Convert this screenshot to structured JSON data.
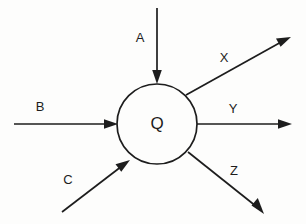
{
  "diagram": {
    "type": "node-flow-diagram",
    "background_color": "#fdfdfc",
    "stroke_color": "#1d1d1d",
    "node": {
      "label": "Q",
      "shape": "circle",
      "center_x": 157,
      "center_y": 124,
      "radius": 40
    },
    "inputs": [
      {
        "label": "A",
        "direction": "from-top",
        "label_x": 140,
        "label_y": 39,
        "x1": 157,
        "y1": 8,
        "x2": 157,
        "y2": 78
      },
      {
        "label": "B",
        "direction": "from-left",
        "label_x": 40,
        "label_y": 108,
        "x1": 14,
        "y1": 124,
        "x2": 111,
        "y2": 124
      },
      {
        "label": "C",
        "direction": "from-lower-left",
        "label_x": 68,
        "label_y": 181,
        "x1": 62,
        "y1": 212,
        "x2": 124,
        "y2": 165
      }
    ],
    "outputs": [
      {
        "label": "X",
        "direction": "to-upper-right",
        "label_x": 224,
        "label_y": 59,
        "x1": 186,
        "y1": 95,
        "x2": 284,
        "y2": 40
      },
      {
        "label": "Y",
        "direction": "to-right",
        "label_x": 233,
        "label_y": 110,
        "x1": 197,
        "y1": 124,
        "x2": 286,
        "y2": 124
      },
      {
        "label": "Z",
        "direction": "to-lower-right",
        "label_x": 234,
        "label_y": 172,
        "x1": 188,
        "y1": 152,
        "x2": 258,
        "y2": 208
      }
    ]
  }
}
